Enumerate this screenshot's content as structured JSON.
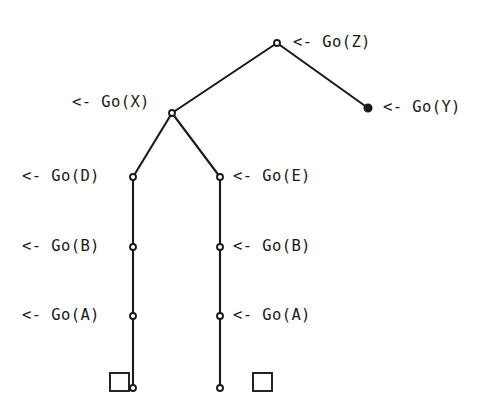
{
  "diagram": {
    "type": "search-tree",
    "stroke_color": "#1a1a1a",
    "background_color": "#ffffff",
    "node_open_fill": "#ffffff",
    "node_filled_fill": "#1a1a1a",
    "canvas": {
      "width": 500,
      "height": 413
    },
    "nodes": [
      {
        "id": "z",
        "label": "<- Go(Z)",
        "x": 277,
        "y": 43,
        "style": "open",
        "label_side": "right",
        "label_x": 293,
        "label_y": 35
      },
      {
        "id": "x",
        "label": "<- Go(X)",
        "x": 172,
        "y": 113,
        "style": "open",
        "label_side": "left",
        "label_x": 72,
        "label_y": 95
      },
      {
        "id": "y",
        "label": "<- Go(Y)",
        "x": 368,
        "y": 108,
        "style": "filled",
        "label_side": "right",
        "label_x": 383,
        "label_y": 100
      },
      {
        "id": "d",
        "label": "<- Go(D)",
        "x": 133,
        "y": 177,
        "style": "open",
        "label_side": "left",
        "label_x": 22,
        "label_y": 169
      },
      {
        "id": "e",
        "label": "<- Go(E)",
        "x": 220,
        "y": 177,
        "style": "open",
        "label_side": "right",
        "label_x": 233,
        "label_y": 169
      },
      {
        "id": "b1",
        "label": "<- Go(B)",
        "x": 133,
        "y": 247,
        "style": "open",
        "label_side": "left",
        "label_x": 22,
        "label_y": 239
      },
      {
        "id": "b2",
        "label": "<- Go(B)",
        "x": 220,
        "y": 247,
        "style": "open",
        "label_side": "right",
        "label_x": 233,
        "label_y": 239
      },
      {
        "id": "a1",
        "label": "<- Go(A)",
        "x": 133,
        "y": 316,
        "style": "open",
        "label_side": "left",
        "label_x": 22,
        "label_y": 308
      },
      {
        "id": "a2",
        "label": "<- Go(A)",
        "x": 220,
        "y": 316,
        "style": "open",
        "label_side": "right",
        "label_x": 233,
        "label_y": 308
      },
      {
        "id": "l1",
        "label": "",
        "x": 133,
        "y": 388,
        "style": "open",
        "label_side": "none",
        "label_x": 0,
        "label_y": 0
      },
      {
        "id": "l2",
        "label": "",
        "x": 220,
        "y": 388,
        "style": "open",
        "label_side": "none",
        "label_x": 0,
        "label_y": 0
      }
    ],
    "edges": [
      {
        "from": "z",
        "to": "x"
      },
      {
        "from": "z",
        "to": "y"
      },
      {
        "from": "x",
        "to": "d"
      },
      {
        "from": "x",
        "to": "e"
      },
      {
        "from": "d",
        "to": "b1"
      },
      {
        "from": "b1",
        "to": "a1"
      },
      {
        "from": "a1",
        "to": "l1"
      },
      {
        "from": "e",
        "to": "b2"
      },
      {
        "from": "b2",
        "to": "a2"
      },
      {
        "from": "a2",
        "to": "l2"
      }
    ],
    "goal_boxes": [
      {
        "id": "goal-left",
        "x": 110,
        "y": 373,
        "width": 19,
        "height": 18
      },
      {
        "id": "goal-right",
        "x": 253,
        "y": 373,
        "width": 19,
        "height": 18
      }
    ]
  }
}
